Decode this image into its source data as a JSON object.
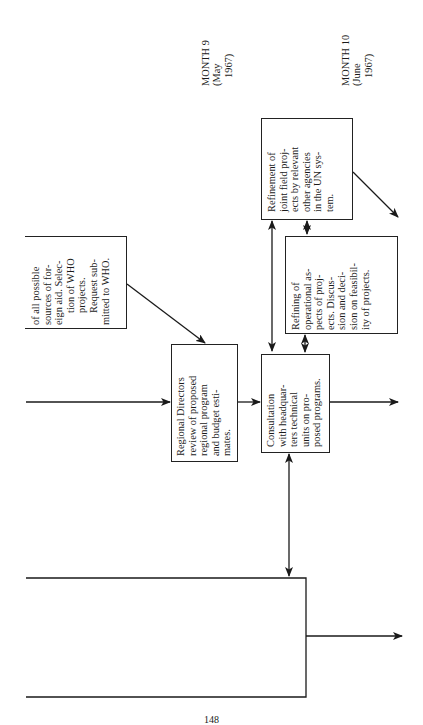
{
  "page": {
    "orientation": "rotated-90-ccw",
    "page_number": "148"
  },
  "timeline": [
    {
      "label": "MONTH 9",
      "sub1": "(May",
      "sub2": "1967)"
    },
    {
      "label": "MONTH 10",
      "sub1": "(June",
      "sub2": "1967)"
    }
  ],
  "boxes": {
    "foreign_aid": {
      "lines": [
        "of all possible",
        "sources of for-",
        "eign aid. Selec-",
        "tion of WHO",
        "projects.",
        "Request sub-",
        "mitted to WHO."
      ]
    },
    "regional_directors": {
      "lines": [
        "Regional Directors",
        "review of proposed",
        "regional program",
        "and budget esti-",
        "mates."
      ]
    },
    "consultation": {
      "lines": [
        "Consultation",
        "with headquar-",
        "ters technical",
        "units on pro-",
        "posed programs."
      ]
    },
    "refining_operational": {
      "lines": [
        "Refining of",
        "operational as-",
        "pects of proj-",
        "ects. Discus-",
        "sion and deci-",
        "sion on feasibil-",
        "ity of projects."
      ]
    },
    "refinement_joint": {
      "lines": [
        "Refinement of",
        "joint field proj-",
        "ects by relevant",
        "other agencies",
        "in the UN sys-",
        "tem."
      ]
    }
  }
}
